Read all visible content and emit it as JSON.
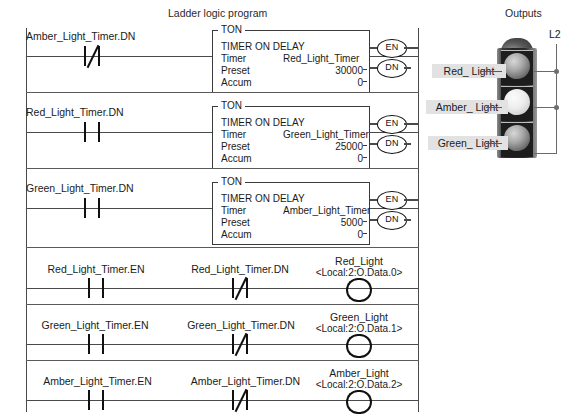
{
  "headings": {
    "ladder": "Ladder logic program",
    "outputs": "Outputs"
  },
  "timer_rungs": [
    {
      "contact_tag": "Amber_Light_Timer.DN",
      "contact_type": "normally-closed",
      "block": {
        "instruction": "TON",
        "title": "TIMER ON DELAY",
        "timer_key": "Timer",
        "timer_value": "Red_Light_Timer",
        "preset_key": "Preset",
        "preset_value": "30000",
        "accum_key": "Accum",
        "accum_value": "0",
        "en_label": "EN",
        "dn_label": "DN"
      }
    },
    {
      "contact_tag": "Red_Light_Timer.DN",
      "contact_type": "normally-open",
      "block": {
        "instruction": "TON",
        "title": "TIMER ON DELAY",
        "timer_key": "Timer",
        "timer_value": "Green_Light_Timer",
        "preset_key": "Preset",
        "preset_value": "25000",
        "accum_key": "Accum",
        "accum_value": "0",
        "en_label": "EN",
        "dn_label": "DN"
      }
    },
    {
      "contact_tag": "Green_Light_Timer.DN",
      "contact_type": "normally-open",
      "block": {
        "instruction": "TON",
        "title": "TIMER ON DELAY",
        "timer_key": "Timer",
        "timer_value": "Amber_Light_Timer",
        "preset_key": "Preset",
        "preset_value": "5000",
        "accum_key": "Accum",
        "accum_value": "0",
        "en_label": "EN",
        "dn_label": "DN"
      }
    }
  ],
  "output_rungs": [
    {
      "contact1_tag": "Red_Light_Timer.EN",
      "contact1_type": "normally-open",
      "contact2_tag": "Red_Light_Timer.DN",
      "contact2_type": "normally-closed",
      "coil_tag": "Red_Light",
      "coil_address": "<Local:2:O.Data.0>"
    },
    {
      "contact1_tag": "Green_Light_Timer.EN",
      "contact1_type": "normally-open",
      "contact2_tag": "Green_Light_Timer.DN",
      "contact2_type": "normally-closed",
      "coil_tag": "Green_Light",
      "coil_address": "<Local:2:O.Data.1>"
    },
    {
      "contact1_tag": "Amber_Light_Timer.EN",
      "contact1_type": "normally-open",
      "contact2_tag": "Amber_Light_Timer.DN",
      "contact2_type": "normally-closed",
      "coil_tag": "Amber_Light",
      "coil_address": "<Local:2:O.Data.2>"
    }
  ],
  "traffic_light": {
    "rail_label": "L2",
    "lamps": [
      {
        "label": "Red_ Light",
        "state": "dark"
      },
      {
        "label": "Amber_ Light",
        "state": "bright"
      },
      {
        "label": "Green_ Light",
        "state": "dark"
      }
    ]
  }
}
